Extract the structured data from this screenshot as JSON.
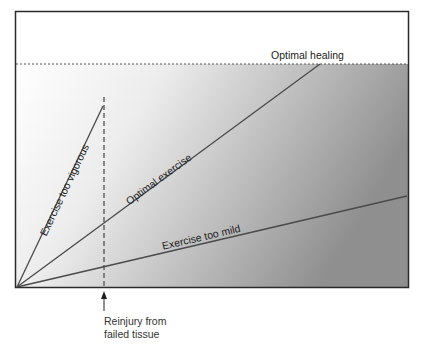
{
  "diagram": {
    "top_label": "Optimal healing",
    "lines": [
      {
        "name": "Exercise too vigorous",
        "label": "Exercise too vigorous"
      },
      {
        "name": "Optimal exercise",
        "label": "Optimal exercise"
      },
      {
        "name": "Exercise too mild",
        "label": "Exercise too mild"
      }
    ],
    "annotation": {
      "line1": "Reinjury from",
      "line2": "failed tissue"
    },
    "colors": {
      "frame": "#2a2a2a",
      "line": "#4a4a4a",
      "gradient_start": "#ffffff",
      "gradient_end": "#8e8e8e"
    }
  }
}
